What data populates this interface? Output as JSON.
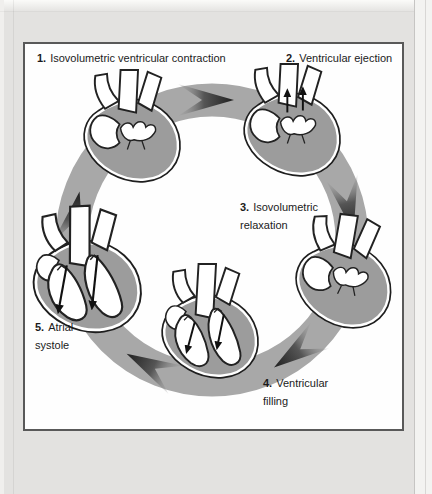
{
  "figure": {
    "type": "cardiac-cycle-diagram",
    "direction": "clockwise",
    "stage_count": "5"
  },
  "stages": [
    {
      "num": "1.",
      "line1": "Isovolumetric ventricular contraction",
      "line2": ""
    },
    {
      "num": "2.",
      "line1": "Ventricular ejection",
      "line2": ""
    },
    {
      "num": "3.",
      "line1": "Isovolumetric",
      "line2": "relaxation"
    },
    {
      "num": "4.",
      "line1": "Ventricular",
      "line2": "filling"
    },
    {
      "num": "5.",
      "line1": "Atrial",
      "line2": "systole"
    }
  ],
  "colors": {
    "page_bg": "#e3e2e0",
    "panel_bg": "#fefefe",
    "panel_border": "#595959",
    "text": "#1b1b1b",
    "ring_gray": "#a8a8a8",
    "arrow_dark": "#2e2e2e",
    "heart_muscle_gray": "#9c9c9c",
    "outline_black": "#1e1e1e"
  }
}
